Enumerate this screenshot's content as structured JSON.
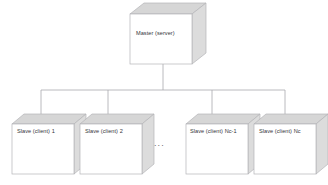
{
  "diagram": {
    "type": "tree",
    "master": {
      "label": "Master (server)",
      "shape": "cube-3d",
      "box": {
        "x": 130,
        "y": 14,
        "w": 62,
        "h": 50
      },
      "depth": 14,
      "label_pos": {
        "x": 136,
        "y": 34
      }
    },
    "slaves": [
      {
        "label": "Slave (client) 1",
        "shape": "cube-3d",
        "box": {
          "x": 12,
          "y": 124,
          "w": 62,
          "h": 50
        },
        "depth": 12,
        "label_pos": {
          "x": 18,
          "y": 131
        },
        "connector_x": 41
      },
      {
        "label": "Slave (client) 2",
        "shape": "cube-3d",
        "box": {
          "x": 80,
          "y": 124,
          "w": 62,
          "h": 50
        },
        "depth": 12,
        "label_pos": {
          "x": 86,
          "y": 131
        },
        "connector_x": 108
      },
      {
        "label": "Slave (client) Nc-1",
        "shape": "cube-3d",
        "box": {
          "x": 186,
          "y": 124,
          "w": 62,
          "h": 50
        },
        "depth": 12,
        "label_pos": {
          "x": 191,
          "y": 131
        },
        "connector_x": 212
      },
      {
        "label": "Slave (client) Nc",
        "shape": "cube-3d",
        "box": {
          "x": 254,
          "y": 124,
          "w": 62,
          "h": 50
        },
        "depth": 12,
        "label_pos": {
          "x": 260,
          "y": 131
        },
        "connector_x": 285
      }
    ],
    "ellipsis": {
      "label": "...",
      "pos": {
        "x": 153,
        "y": 143
      }
    },
    "connectors": {
      "master_stem_x": 163,
      "master_stem_top": 64,
      "bus_y": 90,
      "bus_left": 41,
      "bus_right": 285,
      "drop_bottom": 124
    },
    "colors": {
      "line": "#a8a8ad",
      "outline": "#b4b4b8",
      "face_front": "#ffffff",
      "face_top": "#d6d6d6",
      "face_side": "#dcdcdc",
      "text": "#35353a",
      "background": "#ffffff"
    }
  }
}
